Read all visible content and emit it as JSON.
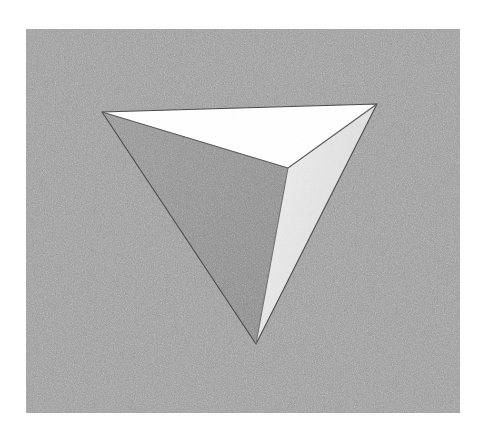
{
  "figure": {
    "medium": "stipple / halftone engraving",
    "canvas": {
      "width": 484,
      "height": 439,
      "page_background": "#ffffff"
    },
    "ground_panel": {
      "name": "textured gray rectangle",
      "x": 26,
      "y": 29,
      "width": 434,
      "height": 384,
      "fill": "#9b9b9b",
      "texture": "random stipple noise",
      "noise_light": "#d8d8d8",
      "noise_dark": "#606060"
    },
    "solid": {
      "name": "tetrahedron",
      "vertices": {
        "left": {
          "label": "left apex",
          "x": 102,
          "y": 112
        },
        "right": {
          "label": "right apex",
          "x": 377,
          "y": 104
        },
        "bottom": {
          "label": "bottom point",
          "x": 256,
          "y": 344
        },
        "near": {
          "label": "near interior apex",
          "x": 288,
          "y": 168
        }
      },
      "faces": [
        {
          "name": "top-face",
          "label": "top face",
          "shading": "white highlight",
          "fill": "#ffffff",
          "points": "102,112 377,104 288,168",
          "tone_value": 100
        },
        {
          "name": "left-face",
          "label": "left shadowed face",
          "shading": "mid gray shadow",
          "fill": "#8e8e8e",
          "points": "102,112 288,168 256,344",
          "tone_value": 56
        },
        {
          "name": "right-face",
          "label": "right lit face",
          "shading": "pale gray",
          "fill": "#ededed",
          "points": "288,168 377,104 256,344",
          "tone_value": 93
        }
      ],
      "edges": [
        {
          "name": "edge-top-left-to-right",
          "from": "left",
          "to": "right"
        },
        {
          "name": "edge-left-to-near",
          "from": "left",
          "to": "near"
        },
        {
          "name": "edge-right-to-near",
          "from": "right",
          "to": "near"
        },
        {
          "name": "edge-near-to-bottom",
          "from": "near",
          "to": "bottom"
        },
        {
          "name": "edge-left-to-bottom",
          "from": "left",
          "to": "bottom"
        },
        {
          "name": "edge-right-to-bottom",
          "from": "right",
          "to": "bottom"
        }
      ],
      "edge_color": "#4a4a4a"
    }
  }
}
